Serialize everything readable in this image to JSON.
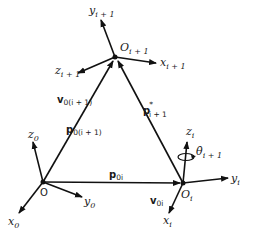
{
  "diagram": {
    "type": "kinematic-frames",
    "points": {
      "origin": {
        "label": "O",
        "x": 43,
        "y": 182
      },
      "frame_i": {
        "label": "O",
        "sub": "i",
        "x": 183,
        "y": 183
      },
      "frame_i1": {
        "label": "O",
        "sub": "i + 1",
        "x": 115,
        "y": 57
      }
    },
    "frame0_axes": {
      "x": {
        "label": "x",
        "sub": "0"
      },
      "y": {
        "label": "y",
        "sub": "0"
      },
      "z": {
        "label": "z",
        "sub": "0"
      }
    },
    "frame_i_axes": {
      "x": {
        "label": "x",
        "sub": "i"
      },
      "y": {
        "label": "y",
        "sub": "i"
      },
      "z": {
        "label": "z",
        "sub": "i"
      }
    },
    "frame_i1_axes": {
      "x": {
        "label": "x",
        "sub": "i + 1"
      },
      "y": {
        "label": "y",
        "sub": "i + 1"
      },
      "z": {
        "label": "z",
        "sub": "i + 1"
      }
    },
    "vectors": {
      "p0i": {
        "label": "p",
        "sub": "0i"
      },
      "v0i": {
        "label": "v",
        "sub": "0i"
      },
      "p0i1": {
        "label": "p",
        "sub": "0(i + 1)"
      },
      "v0i1": {
        "label": "v",
        "sub": "0(i + 1)"
      },
      "pstar": {
        "label": "p",
        "sup": "*",
        "sub": "i + 1"
      }
    },
    "rotation": {
      "label": "θ̇",
      "sub": "i + 1"
    },
    "colors": {
      "stroke": "#111111",
      "background": "#ffffff"
    }
  }
}
